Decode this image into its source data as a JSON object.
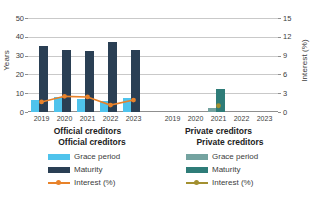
{
  "chart_data": {
    "type": "bar",
    "title": "",
    "subtitle": "",
    "xlabel": "",
    "ylabel": "Years",
    "ylabel_secondary": "Interest (%)",
    "ylim": [
      0,
      50
    ],
    "ylim_secondary": [
      0,
      15
    ],
    "yticks": [
      0,
      10,
      20,
      30,
      40,
      50
    ],
    "yticks_secondary": [
      0,
      3,
      6,
      9,
      12,
      15
    ],
    "grid": true,
    "legend_position": "bottom",
    "categories": [
      "2019",
      "2020",
      "2021",
      "2022",
      "2023"
    ],
    "groups": [
      {
        "name": "Official creditors",
        "series": [
          {
            "name": "Grace period",
            "axis": "left",
            "type": "bar",
            "values": [
              6.2,
              7.8,
              6.8,
              6.0,
              7.2
            ]
          },
          {
            "name": "Maturity",
            "axis": "left",
            "type": "bar",
            "values": [
              35.0,
              33.2,
              32.2,
              37.5,
              33.0
            ]
          },
          {
            "name": "Interest (%)",
            "axis": "right",
            "type": "line",
            "values": [
              1.6,
              2.5,
              2.4,
              1.1,
              1.9
            ]
          }
        ]
      },
      {
        "name": "Private creditors",
        "series": [
          {
            "name": "Grace period",
            "axis": "left",
            "type": "bar",
            "values": [
              null,
              null,
              2.2,
              null,
              null
            ]
          },
          {
            "name": "Maturity",
            "axis": "left",
            "type": "bar",
            "values": [
              null,
              null,
              12.0,
              null,
              null
            ]
          },
          {
            "name": "Interest (%)",
            "axis": "right",
            "type": "line",
            "values": [
              null,
              null,
              1.0,
              null,
              null
            ]
          }
        ]
      }
    ]
  },
  "axes": {
    "left": {
      "title": "Years",
      "ticks": [
        "50",
        "40",
        "30",
        "20",
        "10",
        "0"
      ]
    },
    "right": {
      "title": "Interest (%)",
      "ticks": [
        "15",
        "12",
        "9",
        "6",
        "3",
        "0"
      ]
    },
    "xticks_official": [
      "2019",
      "2020",
      "2021",
      "2022",
      "2023"
    ],
    "xticks_private": [
      "2019",
      "2020",
      "2021",
      "2022",
      "2023"
    ]
  },
  "group_captions": {
    "official": "Official creditors",
    "private": "Private creditors"
  },
  "legend": {
    "official": {
      "heading": "Official creditors",
      "items": [
        {
          "label": "Grace period",
          "marker": "bar-swatch",
          "color": "#4FC3EC"
        },
        {
          "label": "Maturity",
          "marker": "bar-swatch",
          "color": "#2A3F54"
        },
        {
          "label": "Interest (%)",
          "marker": "line-swatch",
          "color": "#E8822A"
        }
      ]
    },
    "private": {
      "heading": "Private creditors",
      "items": [
        {
          "label": "Grace period",
          "marker": "bar-swatch",
          "color": "#74A3A0"
        },
        {
          "label": "Maturity",
          "marker": "bar-swatch",
          "color": "#2E7C78"
        },
        {
          "label": "Interest (%)",
          "marker": "line-swatch",
          "color": "#A39030"
        }
      ]
    }
  },
  "colors": {
    "official_grace": "#4FC3EC",
    "official_maturity": "#2A3F54",
    "official_interest": "#E8822A",
    "private_grace": "#74A3A0",
    "private_maturity": "#2E7C78",
    "private_interest": "#A39030",
    "gridline": "#c9c9c9",
    "axis": "#8f8f8f",
    "text": "#3c3c3c",
    "background": "#ffffff"
  }
}
